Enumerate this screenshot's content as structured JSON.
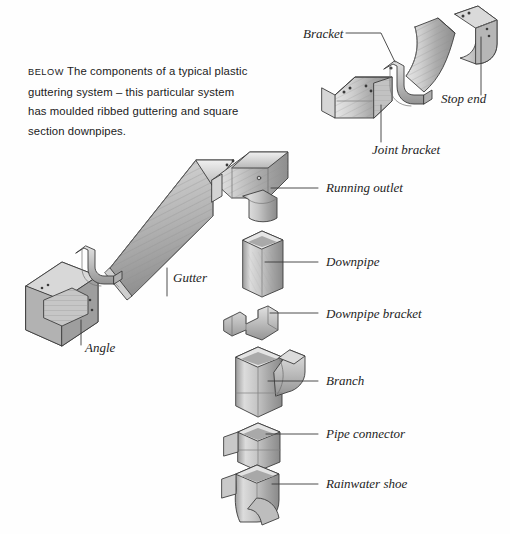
{
  "figure": {
    "type": "exploded-technical-illustration",
    "background_color": "#fefefe",
    "line_color": "#3a3a3a",
    "text_color": "#1d1d1d"
  },
  "caption": {
    "kicker": "BELOW",
    "text": "The components of a typical plastic guttering system – this particular system has moulded ribbed guttering and square section downpipes."
  },
  "labels": {
    "bracket": "Bracket",
    "stop_end": "Stop end",
    "joint_bracket": "Joint bracket",
    "running_outlet": "Running outlet",
    "downpipe": "Downpipe",
    "downpipe_bracket": "Downpipe bracket",
    "branch": "Branch",
    "pipe_connector": "Pipe connector",
    "rainwater_shoe": "Rainwater shoe",
    "gutter": "Gutter",
    "angle": "Angle"
  },
  "components": [
    {
      "name": "bracket",
      "label": "Bracket",
      "shape": "u-shaped support clip"
    },
    {
      "name": "stop-end",
      "label": "Stop end",
      "shape": "capped gutter end"
    },
    {
      "name": "joint-bracket",
      "label": "Joint bracket",
      "shape": "union with flanges"
    },
    {
      "name": "gutter-section",
      "label": "Gutter",
      "shape": "long ribbed trough"
    },
    {
      "name": "running-outlet",
      "label": "Running outlet",
      "shape": "gutter section with downward spigot"
    },
    {
      "name": "downpipe",
      "label": "Downpipe",
      "shape": "vertical square-section tube"
    },
    {
      "name": "downpipe-bracket",
      "label": "Downpipe bracket",
      "shape": "wall clamp"
    },
    {
      "name": "branch",
      "label": "Branch",
      "shape": "Y-junction pipe"
    },
    {
      "name": "pipe-connector",
      "label": "Pipe connector",
      "shape": "short sleeve"
    },
    {
      "name": "rainwater-shoe",
      "label": "Rainwater shoe",
      "shape": "curved outlet at base"
    },
    {
      "name": "angle",
      "label": "Angle",
      "shape": "ribbed corner piece"
    }
  ],
  "palette": {
    "highlight": "#e4e4e4",
    "light": "#d2d2d2",
    "mid": "#b4b4b4",
    "shade": "#9a9a9a",
    "dark": "#7e7e7e",
    "outline": "#3c3c3c"
  }
}
